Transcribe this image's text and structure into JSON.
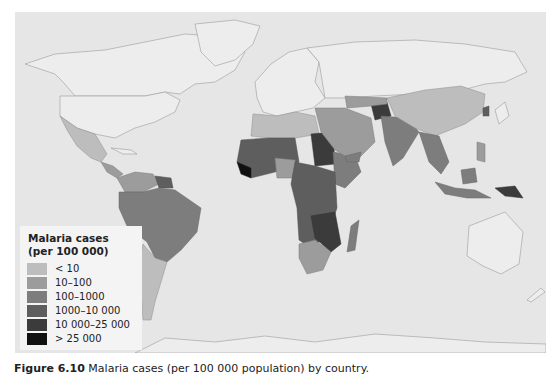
{
  "map": {
    "title": "Malaria cases per 100 000 population by country",
    "background_color": "#e6e6e6"
  },
  "legend": {
    "title_line1": "Malaria cases",
    "title_line2": "(per 100 000)",
    "items": [
      {
        "label": "< 10",
        "color": "#bdbdbd"
      },
      {
        "label": "10–100",
        "color": "#9c9c9c"
      },
      {
        "label": "100–1000",
        "color": "#7d7d7d"
      },
      {
        "label": "1000–10 000",
        "color": "#5e5e5e"
      },
      {
        "label": "10 000–25 000",
        "color": "#3b3b3b"
      },
      {
        "label": "> 25 000",
        "color": "#111111"
      }
    ]
  },
  "caption": {
    "figure_label": "Figure 6.10",
    "text": " Malaria cases (per 100 000 population) by country."
  }
}
